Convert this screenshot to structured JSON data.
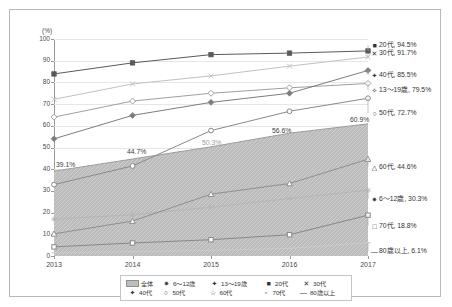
{
  "axes": {
    "y_unit": "(%)",
    "y_ticks": [
      "0",
      "10",
      "20",
      "30",
      "40",
      "50",
      "60",
      "70",
      "80",
      "90",
      "100"
    ],
    "x_ticks": [
      "2013",
      "2014",
      "2015",
      "2016",
      "2017"
    ]
  },
  "legend": {
    "row1": [
      {
        "key": "area-swatch",
        "label": "全体"
      },
      {
        "key": "✷",
        "label": "6〜12歳"
      },
      {
        "key": "✦",
        "label": "13〜19歳"
      },
      {
        "key": "■",
        "label": "20代"
      },
      {
        "key": "✕",
        "label": "30代"
      }
    ],
    "row2": [
      {
        "key": "✦",
        "label": "40代"
      },
      {
        "key": "○",
        "label": "50代"
      },
      {
        "key": "☆",
        "label": "60代"
      },
      {
        "key": "▫",
        "label": "70代"
      },
      {
        "key": "―",
        "label": "80歳以上"
      }
    ]
  },
  "series_labels": [
    {
      "marker": "■",
      "text": "20代, 94.5%"
    },
    {
      "marker": "✕",
      "text": "30代, 91.7%"
    },
    {
      "marker": "✦",
      "text": "40代, 85.5%"
    },
    {
      "marker": "✧",
      "text": "13〜19歳, 79.5%"
    },
    {
      "marker": "○",
      "text": "50代, 72.7%"
    },
    {
      "marker": "△",
      "text": "60代, 44.6%"
    },
    {
      "marker": "✷",
      "text": "6〜12歳, 30.3%"
    },
    {
      "marker": "□",
      "text": "70代, 18.8%"
    },
    {
      "marker": "―",
      "text": "80歳以上, 6.1%"
    }
  ],
  "area_labels": [
    "39.1%",
    "44.7%",
    "50.3%",
    "56.6%",
    "60.9%"
  ],
  "chart_data": {
    "type": "line",
    "title": "",
    "xlabel": "",
    "ylabel": "(%)",
    "x": [
      "2013",
      "2014",
      "2015",
      "2016",
      "2017"
    ],
    "ylim": [
      0,
      100
    ],
    "grid": true,
    "legend_position": "bottom",
    "series": [
      {
        "name": "全体",
        "type": "area",
        "values": [
          39.1,
          44.7,
          50.3,
          56.6,
          60.9
        ],
        "marker": "none",
        "labeled": true
      },
      {
        "name": "6〜12歳",
        "type": "line",
        "values": [
          17.0,
          19.0,
          22.5,
          26.5,
          30.3
        ],
        "marker": "star"
      },
      {
        "name": "13〜19歳",
        "type": "line",
        "values": [
          64.0,
          71.4,
          75.0,
          77.5,
          79.5
        ],
        "marker": "diamond-open"
      },
      {
        "name": "20代",
        "type": "line",
        "values": [
          83.9,
          89.0,
          92.8,
          93.5,
          94.5
        ],
        "marker": "square-filled"
      },
      {
        "name": "30代",
        "type": "line",
        "values": [
          72.2,
          79.3,
          83.0,
          87.5,
          91.7
        ],
        "marker": "cross"
      },
      {
        "name": "40代",
        "type": "line",
        "values": [
          54.0,
          64.8,
          70.8,
          75.0,
          85.5
        ],
        "marker": "diamond-filled"
      },
      {
        "name": "50代",
        "type": "line",
        "values": [
          32.9,
          41.5,
          57.8,
          66.7,
          72.7
        ],
        "marker": "circle-open"
      },
      {
        "name": "60代",
        "type": "line",
        "values": [
          10.2,
          16.1,
          28.5,
          33.4,
          44.6
        ],
        "marker": "triangle-open"
      },
      {
        "name": "70代",
        "type": "line",
        "values": [
          4.2,
          6.0,
          7.5,
          9.8,
          18.8
        ],
        "marker": "square-open"
      },
      {
        "name": "80歳以上",
        "type": "line",
        "values": [
          1.5,
          2.0,
          2.6,
          3.5,
          6.1
        ],
        "marker": "dash"
      }
    ]
  }
}
